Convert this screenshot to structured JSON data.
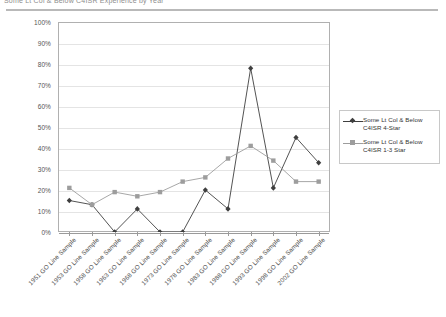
{
  "document": {
    "title": "Some Lt Col & Below C4ISR Experience by Year"
  },
  "legend": {
    "position": "right",
    "entries": [
      {
        "label_line1": "Some Lt Col & Below",
        "label_line2": "C4ISR  4-Star",
        "marker": "diamond",
        "color": "#3f3f3f"
      },
      {
        "label_line1": "Some Lt Col & Below",
        "label_line2": "C4ISR 1-3 Star",
        "marker": "square",
        "color": "#9d9d9d"
      }
    ]
  },
  "chart_data": {
    "type": "line",
    "title": "Some Lt Col & Below C4ISR Experience by Year",
    "xlabel": "",
    "ylabel": "",
    "ylim": [
      0,
      100
    ],
    "yticks": [
      "0%",
      "10%",
      "20%",
      "30%",
      "40%",
      "50%",
      "60%",
      "70%",
      "80%",
      "90%",
      "100%"
    ],
    "ytick_values": [
      0,
      10,
      20,
      30,
      40,
      50,
      60,
      70,
      80,
      90,
      100
    ],
    "grid": true,
    "legend_position": "right",
    "categories": [
      "1951 GO Line Sample",
      "1953 GO Line Sample",
      "1958 GO Line Sample",
      "1963 GO Line Sample",
      "1968 GO Line Sample",
      "1973 GO Line Sample",
      "1978 GO Line Sample",
      "1983 GO Line Sample",
      "1988 GO Line Sample",
      "1993 GO Line Sample",
      "1998 GO Line Sample",
      "2002 GO Line Sample"
    ],
    "series": [
      {
        "name": "Some Lt Col & Below C4ISR  4-Star",
        "marker": "diamond",
        "color": "#3f3f3f",
        "values": [
          15,
          13,
          0,
          11,
          0,
          0,
          20,
          11,
          78,
          21,
          45,
          33
        ]
      },
      {
        "name": "Some Lt Col & Below C4ISR 1-3 Star",
        "marker": "square",
        "color": "#9d9d9d",
        "values": [
          21,
          13,
          19,
          17,
          19,
          24,
          26,
          35,
          41,
          34,
          24,
          24
        ]
      }
    ]
  }
}
